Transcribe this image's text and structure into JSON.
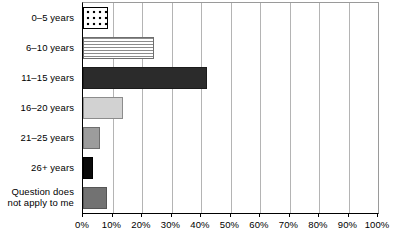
{
  "chart_data": {
    "type": "bar",
    "orientation": "horizontal",
    "title": "",
    "xlabel": "",
    "ylabel": "",
    "xlim": [
      0,
      100
    ],
    "grid": true,
    "legend": false,
    "categories": [
      "0–5 years",
      "6–10 years",
      "11–15 years",
      "16–20 years",
      "21–25 years",
      "26+ years",
      "Question does not apply to me"
    ],
    "values": [
      8.5,
      24,
      42,
      13.5,
      5.7,
      3.4,
      8
    ],
    "tick_labels": [
      "0%",
      "10%",
      "20%",
      "30%",
      "40%",
      "50%",
      "60%",
      "70%",
      "80%",
      "90%",
      "100%"
    ],
    "tick_values": [
      0,
      10,
      20,
      30,
      40,
      50,
      60,
      70,
      80,
      90,
      100
    ],
    "bar_styles": [
      "fill-dots",
      "fill-hstripe",
      "fill-charcoal",
      "fill-lightgray",
      "fill-midgray",
      "fill-black",
      "fill-darkgray"
    ],
    "bar_colors": [
      "#ffffff",
      "#ffffff",
      "#2b2b2b",
      "#d2d2d2",
      "#9c9c9c",
      "#0a0a0a",
      "#727272"
    ],
    "label_lines": [
      [
        "0–5 years"
      ],
      [
        "6–10 years"
      ],
      [
        "11–15 years"
      ],
      [
        "16–20 years"
      ],
      [
        "21–25 years"
      ],
      [
        "26+ years"
      ],
      [
        "Question does",
        "not apply to me"
      ]
    ]
  }
}
